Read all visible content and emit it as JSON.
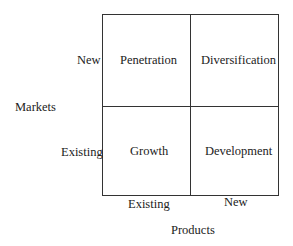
{
  "diagram": {
    "type": "2x2 matrix",
    "axes": {
      "y_label": "Markets",
      "y_ticks": [
        "New",
        "Existing"
      ],
      "x_label": "Products",
      "x_ticks": [
        "Existing",
        "New"
      ]
    },
    "cells": {
      "top_left": "Penetration",
      "top_right": "Diversification",
      "bottom_left": "Growth",
      "bottom_right": "Development"
    }
  }
}
